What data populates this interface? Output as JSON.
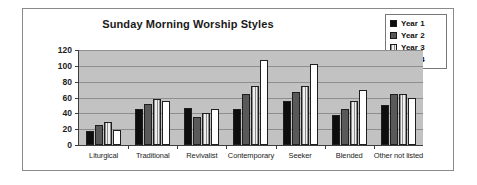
{
  "chart_data": {
    "type": "bar",
    "title": "Sunday Morning Worship Styles",
    "xlabel": "",
    "ylabel": "",
    "ylim": [
      0,
      120
    ],
    "yticks": [
      0,
      20,
      40,
      60,
      80,
      100,
      120
    ],
    "grid": true,
    "legend_position": "top-right",
    "categories": [
      "Liturgical",
      "Traditional",
      "Revivalist",
      "Contemporary",
      "Seeker",
      "Blended",
      "Other not listed"
    ],
    "series": [
      {
        "name": "Year 1",
        "color": "#0d0d0d",
        "values": [
          18,
          45,
          47,
          46,
          56,
          38,
          51
        ]
      },
      {
        "name": "Year 2",
        "color": "#595959",
        "values": [
          25,
          52,
          36,
          65,
          67,
          46,
          65
        ]
      },
      {
        "name": "Year 3",
        "color": "#e2e2e2",
        "values": [
          29,
          58,
          40,
          75,
          75,
          55,
          64
        ]
      },
      {
        "name": "Year 4",
        "color": "#ffffff",
        "values": [
          19,
          56,
          45,
          107,
          102,
          69,
          59
        ]
      }
    ]
  },
  "legend": {
    "items": [
      {
        "label": "Year 1"
      },
      {
        "label": "Year 2"
      },
      {
        "label": "Year 3"
      },
      {
        "label": "Year 4"
      }
    ]
  },
  "axis": {
    "y_tick_labels": [
      "120",
      "100",
      "80",
      "60",
      "40",
      "20",
      "0"
    ]
  }
}
